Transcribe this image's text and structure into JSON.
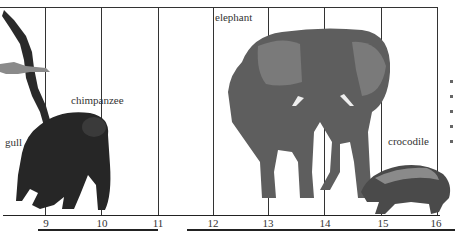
{
  "diagram": {
    "type": "size-scale-comparison",
    "scale_ticks": [
      "9",
      "10",
      "11",
      "12",
      "13",
      "14",
      "15",
      "16"
    ],
    "animals": [
      {
        "name": "gull",
        "label": "gull"
      },
      {
        "name": "chimpanzee",
        "label": "chimpanzee"
      },
      {
        "name": "elephant",
        "label": "elephant"
      },
      {
        "name": "crocodile",
        "label": "crocodile"
      }
    ],
    "colors": {
      "line": "#333333",
      "animal_dark": "#2a2a2a",
      "animal_mid": "#6b6b6b",
      "background": "#ffffff"
    }
  }
}
